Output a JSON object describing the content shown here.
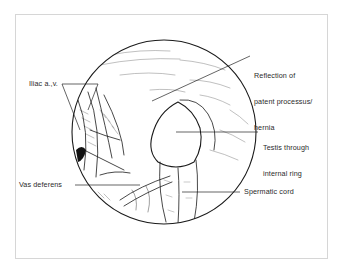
{
  "figure": {
    "type": "anatomical laparoscopic illustration",
    "labels": [
      {
        "id": "iliac",
        "text": "Iliac a.,v."
      },
      {
        "id": "reflection",
        "lines": [
          "Reflection of",
          "patent processus/",
          "hernia"
        ]
      },
      {
        "id": "testis",
        "lines": [
          "Testis through",
          "internal ring"
        ]
      },
      {
        "id": "vas",
        "text": "Vas deferens"
      },
      {
        "id": "cord",
        "text": "Spermatic cord"
      }
    ]
  },
  "colors": {
    "ink": "#1a1a1a",
    "frame": "#d6d6d6",
    "background": "#ffffff"
  }
}
